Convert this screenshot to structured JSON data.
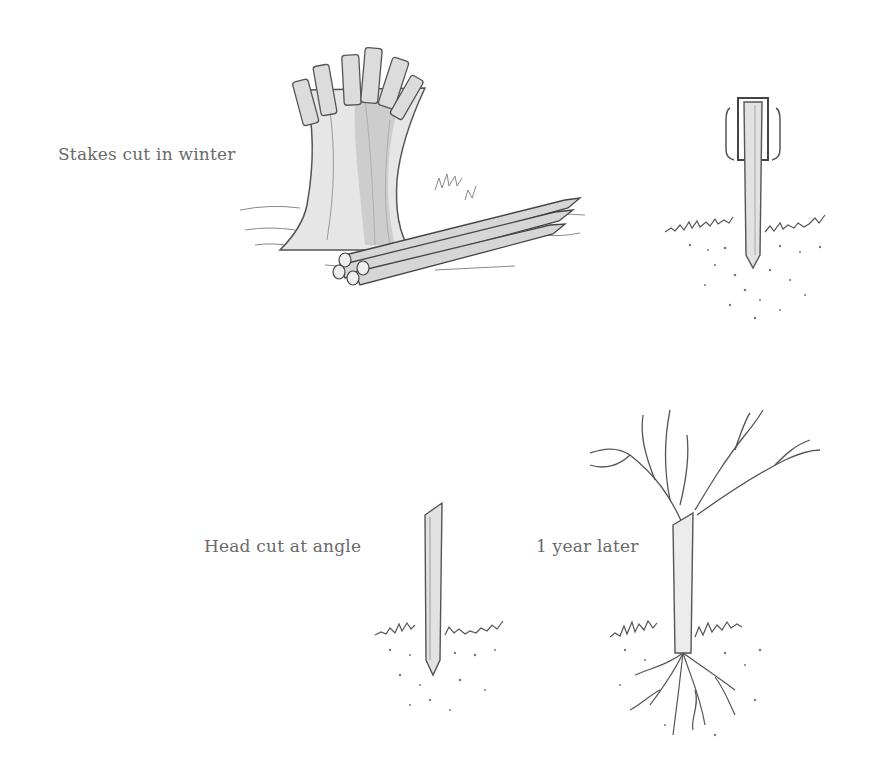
{
  "diagram": {
    "panels": [
      {
        "id": "pollard",
        "label": "Stakes cut in winter",
        "illustration": "pollarded-willow-stump-with-cut-stakes"
      },
      {
        "id": "driving",
        "label": "",
        "illustration": "stake-being-driven-with-post-driver"
      },
      {
        "id": "angle",
        "label": "Head cut at angle",
        "illustration": "stake-in-ground-with-angled-top"
      },
      {
        "id": "growth",
        "label": "1 year later",
        "illustration": "rooted-stake-with-branches"
      }
    ]
  }
}
